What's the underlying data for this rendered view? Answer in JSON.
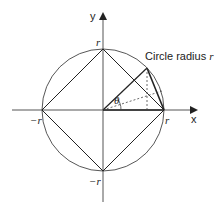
{
  "diagram": {
    "title": "Circle radius r",
    "title_prefix": "Circle radius ",
    "title_var": "r",
    "axes": {
      "x_label": "x",
      "y_label": "y"
    },
    "tick_labels": {
      "top": "r",
      "right": "r",
      "left": "−r",
      "bottom": "−r"
    },
    "angle_label": "θ",
    "colors": {
      "stroke": "#222222",
      "background": "#ffffff"
    }
  }
}
